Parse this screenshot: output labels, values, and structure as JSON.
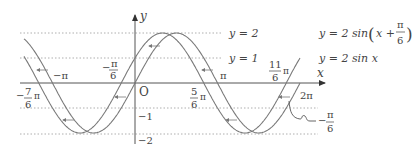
{
  "diagram": {
    "type": "function-graph",
    "axes": {
      "x_label": "x",
      "y_label": "y",
      "origin_label": "O"
    },
    "curves": [
      {
        "name": "shifted",
        "label": "y = 2 sin (x + π/6)",
        "label_main": "y = 2 sin",
        "label_paren_open": "(",
        "label_x": "x +",
        "label_frac_num": "π",
        "label_frac_den": "6",
        "label_paren_close": ")",
        "color": "#7a7a7a"
      },
      {
        "name": "base",
        "label": "y = 2 sin x",
        "color": "#7a7a7a"
      }
    ],
    "reference_lines": [
      {
        "y": 2,
        "label": "y = 2"
      },
      {
        "y": 1,
        "label": "y = 1"
      },
      {
        "y": -1,
        "label": "−1"
      },
      {
        "y": -2,
        "label": "−2"
      }
    ],
    "x_tick_labels": {
      "neg_pi": "−π",
      "neg_pi_6_num": "π",
      "neg_pi_6_den": "6",
      "neg_7_6_num": "7",
      "neg_7_6_den": "6",
      "five_6_num": "5",
      "five_6_den": "6",
      "pi": "π",
      "eleven_6_num": "11",
      "eleven_6_den": "6",
      "two_pi": "2π",
      "pi_sym": "π",
      "minus": "−"
    },
    "shift_annotation": {
      "label": "−π/6",
      "num": "π",
      "den": "6"
    },
    "colors": {
      "curve": "#7a7a7a",
      "axis": "#555555",
      "dotted": "#999999",
      "text": "#444444"
    }
  }
}
